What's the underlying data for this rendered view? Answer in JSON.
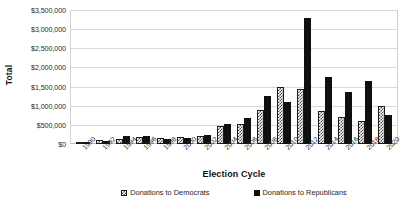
{
  "chart_data": {
    "type": "bar",
    "title": "",
    "xlabel": "Election Cycle",
    "ylabel": "Total",
    "ylim": [
      0,
      3500000
    ],
    "ytick_labels": [
      "$3,500,000",
      "$3,000,000",
      "$2,500,000",
      "$2,000,000",
      "$1,500,000",
      "$1,000,000",
      "$500,000",
      "$0"
    ],
    "ytick_values": [
      3500000,
      3000000,
      2500000,
      2000000,
      1500000,
      1000000,
      500000,
      0
    ],
    "grid": true,
    "legend_position": "bottom",
    "categories": [
      "1990",
      "1992",
      "1994",
      "1996",
      "1998",
      "2000",
      "2002",
      "2004",
      "2006",
      "2008",
      "2010",
      "2012",
      "2014",
      "2016",
      "2018",
      "2020"
    ],
    "series": [
      {
        "name": "Donations to Democrats",
        "pattern": "checkered",
        "color": "#4a4a4a",
        "values": [
          60000,
          95000,
          120000,
          190000,
          170000,
          185000,
          210000,
          480000,
          520000,
          900000,
          1500000,
          1450000,
          850000,
          700000,
          600000,
          1000000
        ]
      },
      {
        "name": "Donations to Republicans",
        "pattern": "solid",
        "color": "#101010",
        "values": [
          30000,
          75000,
          200000,
          210000,
          140000,
          170000,
          230000,
          520000,
          680000,
          1250000,
          1100000,
          3300000,
          1750000,
          1350000,
          1650000,
          750000
        ]
      }
    ]
  },
  "legend": {
    "items": [
      {
        "label": "Donations to Democrats"
      },
      {
        "label": "Donations to Republicans"
      }
    ]
  }
}
